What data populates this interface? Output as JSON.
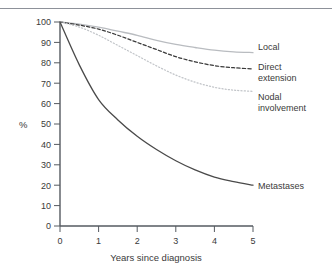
{
  "figure": {
    "top_rule": true,
    "axis_value_label": "%"
  },
  "chart_data": {
    "type": "line",
    "title": "",
    "subtitle": "",
    "xlabel": "Years since diagnosis",
    "ylabel": "%",
    "xlim": [
      0,
      5
    ],
    "ylim": [
      0,
      100
    ],
    "grid": false,
    "legend_position": "right-inline-annotations",
    "xticks": [
      0,
      1,
      2,
      3,
      4,
      5
    ],
    "xtick_labels": [
      "0",
      "1",
      "2",
      "3",
      "4",
      "5"
    ],
    "yticks": [
      0,
      10,
      20,
      30,
      40,
      50,
      60,
      70,
      80,
      90,
      100
    ],
    "ytick_labels": [
      "0",
      "10",
      "20",
      "30",
      "40",
      "50",
      "60",
      "70",
      "80",
      "90",
      "100"
    ],
    "x": [
      0,
      0.5,
      1,
      1.5,
      2,
      2.5,
      3,
      3.5,
      4,
      4.5,
      5
    ],
    "series": [
      {
        "name": "Local",
        "style": "solid",
        "color": "#b9bcc0",
        "values": [
          100,
          99,
          97.5,
          95.5,
          93.5,
          91,
          89,
          87.5,
          86.2,
          85.4,
          85
        ]
      },
      {
        "name": "Direct extension",
        "style": "dashed",
        "color": "#3a3a3a",
        "values": [
          100,
          98.5,
          96.5,
          93.5,
          90,
          86.5,
          83,
          80.5,
          78.6,
          77.6,
          77
        ]
      },
      {
        "name": "Nodal involvement",
        "style": "dotted",
        "color": "#c2c5c9",
        "values": [
          100,
          97.5,
          93.5,
          88.5,
          83.5,
          78.5,
          74,
          70.5,
          68,
          66.6,
          66
        ]
      },
      {
        "name": "Metastases",
        "style": "solid",
        "color": "#4a4a4a",
        "values": [
          100,
          79,
          62,
          52,
          44,
          37.5,
          32,
          27.5,
          24,
          21.8,
          20
        ]
      }
    ],
    "annotations": [
      {
        "text": "Local",
        "series": "Local",
        "at_x": 5,
        "at_y": 85
      },
      {
        "text": "Direct",
        "series": "Direct extension",
        "at_x": 5,
        "at_y": 77
      },
      {
        "text": "extension",
        "series": "Direct extension",
        "at_x": 5,
        "at_y": 77
      },
      {
        "text": "Nodal",
        "series": "Nodal involvement",
        "at_x": 5,
        "at_y": 66
      },
      {
        "text": "involvement",
        "series": "Nodal involvement",
        "at_x": 5,
        "at_y": 66
      },
      {
        "text": "Metastases",
        "series": "Metastases",
        "at_x": 5,
        "at_y": 20
      }
    ]
  },
  "labels": {
    "local": "Local",
    "direct_line1": "Direct",
    "direct_line2": "extension",
    "nodal_line1": "Nodal",
    "nodal_line2": "involvement",
    "metastases": "Metastases",
    "xaxis_title": "Years since diagnosis",
    "yaxis_title": "%"
  }
}
